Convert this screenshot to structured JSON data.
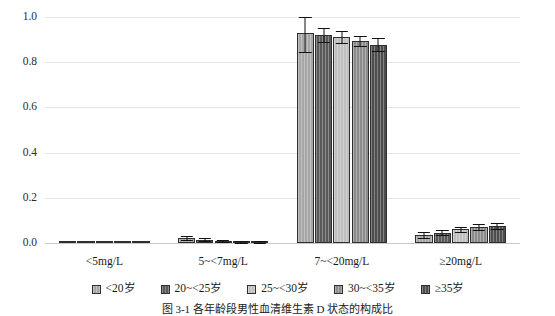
{
  "chart_data": {
    "type": "bar",
    "title": "",
    "caption": "图 3-1  各年龄段男性血清维生素 D 状态的构成比",
    "xlabel": "",
    "ylabel": "",
    "ylim": [
      0.0,
      1.0
    ],
    "ytick_labels": [
      "0.0",
      "0.2",
      "0.4",
      "0.6",
      "0.8",
      "1.0"
    ],
    "ytick_values": [
      0.0,
      0.2,
      0.4,
      0.6,
      0.8,
      1.0
    ],
    "grid": true,
    "legend_position": "bottom",
    "error_bars": true,
    "categories": [
      "<5mg/L",
      "5~<7mg/L",
      "7~<20mg/L",
      "≥20mg/L"
    ],
    "series": [
      {
        "name": "<20岁",
        "color": "#a6a6a6",
        "values": [
          0.0,
          0.022,
          0.93,
          0.035
        ],
        "err_low": [
          0.0,
          0.008,
          0.085,
          0.012
        ],
        "err_high": [
          0.0,
          0.008,
          0.07,
          0.012
        ]
      },
      {
        "name": "20~<25岁",
        "color": "#595959",
        "values": [
          0.0,
          0.015,
          0.92,
          0.046
        ],
        "err_low": [
          0.0,
          0.006,
          0.03,
          0.012
        ],
        "err_high": [
          0.0,
          0.006,
          0.03,
          0.012
        ]
      },
      {
        "name": "25~<30岁",
        "color": "#bfbfbf",
        "values": [
          0.0,
          0.01,
          0.912,
          0.06
        ],
        "err_low": [
          0.0,
          0.005,
          0.025,
          0.012
        ],
        "err_high": [
          0.0,
          0.005,
          0.025,
          0.012
        ]
      },
      {
        "name": "30~<35岁",
        "color": "#8c8c8c",
        "values": [
          0.0,
          0.006,
          0.895,
          0.071
        ],
        "err_low": [
          0.0,
          0.004,
          0.022,
          0.012
        ],
        "err_high": [
          0.0,
          0.004,
          0.022,
          0.012
        ]
      },
      {
        "name": "≥35岁",
        "color": "#4d4d4d",
        "values": [
          0.0,
          0.005,
          0.878,
          0.076
        ],
        "err_low": [
          0.0,
          0.003,
          0.03,
          0.012
        ],
        "err_high": [
          0.0,
          0.003,
          0.03,
          0.012
        ]
      }
    ]
  }
}
